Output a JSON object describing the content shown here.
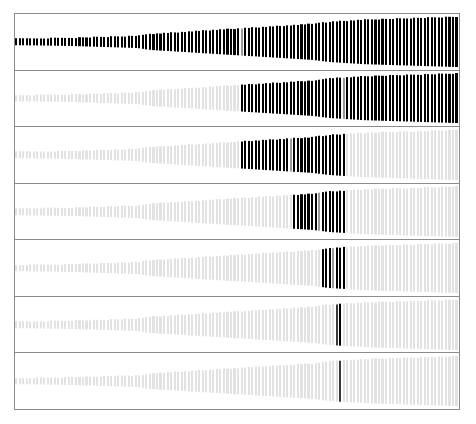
{
  "figure": {
    "title": "",
    "background_color": "#ffffff",
    "frame_color": "#8c8c8c",
    "panel_count": 7,
    "bar_count_per_panel": 126,
    "colors": {
      "bar_on": "#000000",
      "bar_off": "#e2e2e2",
      "marker_fill": "#ffffff",
      "marker_stroke": "#3a3a3a"
    }
  },
  "chart_data": {
    "type": "bar",
    "title": "",
    "xlabel": "",
    "ylabel": "",
    "grid": false,
    "legend": null,
    "orientation": "vertical",
    "x": [
      1,
      2,
      3,
      4,
      5,
      6,
      7,
      8,
      9,
      10,
      11,
      12,
      13,
      14,
      15,
      16,
      17,
      18,
      19,
      20,
      21,
      22,
      23,
      24,
      25,
      26,
      27,
      28,
      29,
      30,
      31,
      32,
      33,
      34,
      35,
      36,
      37,
      38,
      39,
      40,
      41,
      42,
      43,
      44,
      45,
      46,
      47,
      48,
      49,
      50,
      51,
      52,
      53,
      54,
      55,
      56,
      57,
      58,
      59,
      60,
      61,
      62,
      63,
      64,
      65,
      66,
      67,
      68,
      69,
      70,
      71,
      72,
      73,
      74,
      75,
      76,
      77,
      78,
      79,
      80,
      81,
      82,
      83,
      84,
      85,
      86,
      87,
      88,
      89,
      90,
      91,
      92,
      93,
      94,
      95,
      96,
      97,
      98,
      99,
      100,
      101,
      102,
      103,
      104,
      105,
      106,
      107,
      108,
      109,
      110,
      111,
      112,
      113,
      114,
      115,
      116,
      117,
      118,
      119,
      120,
      121,
      122,
      123,
      124,
      125,
      126
    ],
    "heights": [
      6,
      6,
      6,
      6,
      6.2,
      6.2,
      6.4,
      6.4,
      6.6,
      6.6,
      6.8,
      6.8,
      7,
      7,
      7.2,
      7.2,
      7.4,
      7.6,
      7.8,
      8,
      8.2,
      8.4,
      8.6,
      8.8,
      9,
      9.2,
      9.4,
      9.6,
      9.8,
      10,
      10.2,
      10.4,
      10.6,
      10.8,
      11,
      11.6,
      12.6,
      13.6,
      14.4,
      15,
      15.4,
      15.8,
      16.2,
      16.6,
      17,
      17.4,
      17.8,
      18.2,
      18.6,
      19,
      19.4,
      19.8,
      20.2,
      20.6,
      21,
      21.4,
      21.8,
      22.2,
      22.6,
      23,
      23.4,
      23.8,
      24.2,
      24.6,
      25,
      25.4,
      25.8,
      26.2,
      26.6,
      27,
      27.4,
      27.8,
      28.2,
      28.6,
      29,
      29.4,
      29.8,
      30.2,
      30.6,
      31,
      31.4,
      31.8,
      32.2,
      32.6,
      33,
      33.8,
      34.6,
      35.4,
      36.2,
      37,
      37.4,
      37.8,
      38.2,
      38.6,
      39,
      39.4,
      39.8,
      40.2,
      40.6,
      41,
      41.2,
      41.4,
      41.6,
      41.8,
      42,
      42.2,
      42.4,
      42.6,
      42.8,
      43,
      43.2,
      43.4,
      43.6,
      43.8,
      44,
      44.2,
      44.4,
      44.6,
      44.8,
      45,
      45.2,
      45.4,
      45.6,
      45.8,
      46,
      46.2
    ],
    "ylim": [
      0,
      48
    ],
    "xlim": [
      1,
      126
    ],
    "panels": [
      {
        "index": 1,
        "label": "",
        "selected_start": 1,
        "selected_end": 126,
        "selected_count": 126,
        "marker_index": 65,
        "marker_style": "marker-light"
      },
      {
        "index": 2,
        "label": "",
        "selected_start": 65,
        "selected_end": 126,
        "selected_count": 62,
        "marker_index": 94,
        "marker_style": "marker-light"
      },
      {
        "index": 3,
        "label": "",
        "selected_start": 65,
        "selected_end": 94,
        "selected_count": 30,
        "marker_index": 79,
        "marker_style": "marker-light"
      },
      {
        "index": 4,
        "label": "",
        "selected_start": 80,
        "selected_end": 94,
        "selected_count": 15,
        "marker_index": 87,
        "marker_style": "marker-light"
      },
      {
        "index": 5,
        "label": "",
        "selected_start": 88,
        "selected_end": 94,
        "selected_count": 7,
        "marker_index": 91,
        "marker_style": "marker-light"
      },
      {
        "index": 6,
        "label": "",
        "selected_start": 92,
        "selected_end": 93,
        "selected_count": 2,
        "marker_index": 92,
        "marker_style": "marker"
      },
      {
        "index": 7,
        "label": "",
        "selected_start": 93,
        "selected_end": 93,
        "selected_count": 1,
        "marker_index": 93,
        "marker_style": "marker"
      }
    ]
  }
}
